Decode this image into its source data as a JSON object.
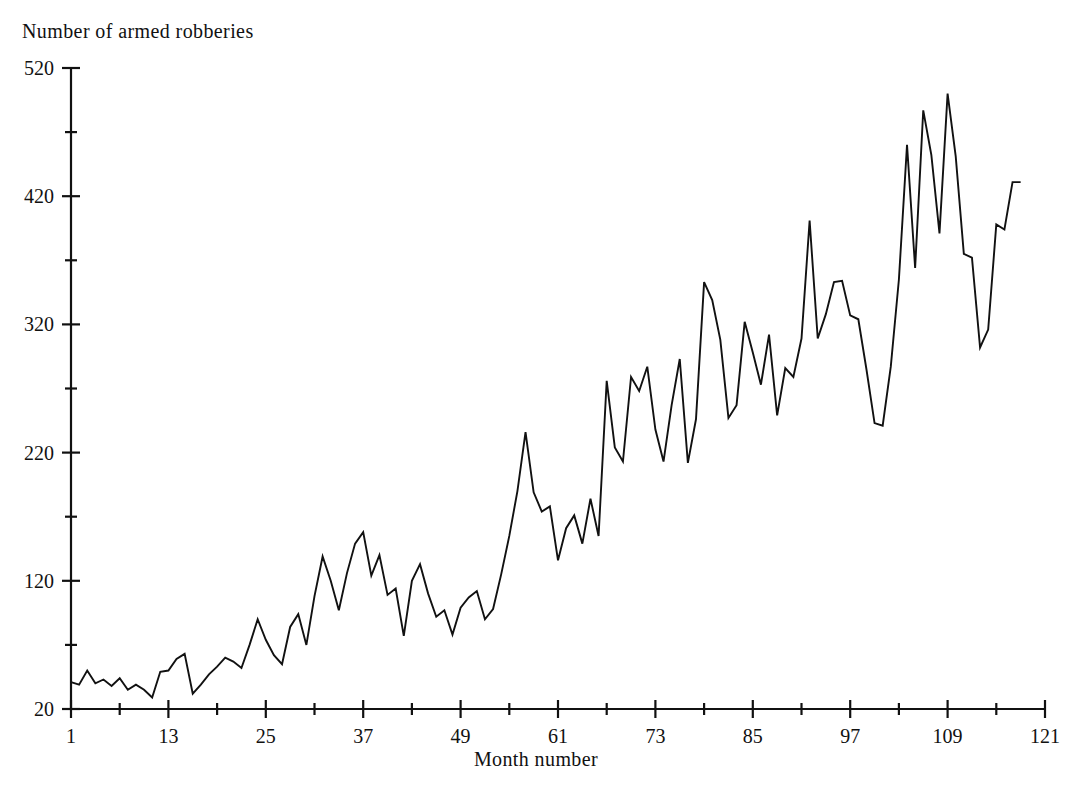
{
  "chart_data": {
    "type": "line",
    "title": "",
    "ylabel": "Number of armed robberies",
    "xlabel": "Month number",
    "ylim": [
      20,
      520
    ],
    "xlim": [
      1,
      121
    ],
    "grid": false,
    "legend": "none",
    "y_ticks": [
      20,
      120,
      220,
      320,
      420,
      520
    ],
    "y_tick_labels": [
      "20",
      "120",
      "220",
      "320",
      "420",
      "520"
    ],
    "y_minor_ticks": [
      70,
      170,
      270,
      370,
      470
    ],
    "x_ticks": [
      1,
      13,
      25,
      37,
      49,
      61,
      73,
      85,
      97,
      109,
      121
    ],
    "x_tick_labels": [
      "1",
      "13",
      "25",
      "37",
      "49",
      "61",
      "73",
      "85",
      "97",
      "109",
      "121"
    ],
    "x_minor_ticks": [
      7,
      19,
      31,
      43,
      55,
      67,
      79,
      91,
      103,
      115
    ],
    "series": [
      {
        "name": "Armed robberies",
        "x": [
          1,
          2,
          3,
          4,
          5,
          6,
          7,
          8,
          9,
          10,
          11,
          12,
          13,
          14,
          15,
          16,
          17,
          18,
          19,
          20,
          21,
          22,
          23,
          24,
          25,
          26,
          27,
          28,
          29,
          30,
          31,
          32,
          33,
          34,
          35,
          36,
          37,
          38,
          39,
          40,
          41,
          42,
          43,
          44,
          45,
          46,
          47,
          48,
          49,
          50,
          51,
          52,
          53,
          54,
          55,
          56,
          57,
          58,
          59,
          60,
          61,
          62,
          63,
          64,
          65,
          66,
          67,
          68,
          69,
          70,
          71,
          72,
          73,
          74,
          75,
          76,
          77,
          78,
          79,
          80,
          81,
          82,
          83,
          84,
          85,
          86,
          87,
          88,
          89,
          90,
          91,
          92,
          93,
          94,
          95,
          96,
          97,
          98,
          99,
          100,
          101,
          102,
          103,
          104,
          105,
          106,
          107,
          108,
          109,
          110,
          111,
          112,
          113,
          114,
          115,
          116,
          117,
          118
        ],
        "values": [
          41,
          39,
          50,
          40,
          43,
          38,
          44,
          35,
          39,
          35,
          29,
          49,
          50,
          59,
          63,
          32,
          39,
          47,
          53,
          60,
          57,
          52,
          70,
          90,
          74,
          62,
          55,
          84,
          94,
          70,
          108,
          139,
          120,
          97,
          126,
          149,
          158,
          124,
          140,
          109,
          114,
          77,
          120,
          133,
          110,
          92,
          97,
          78,
          99,
          107,
          112,
          90,
          98,
          125,
          155,
          190,
          236,
          189,
          174,
          178,
          136,
          161,
          171,
          149,
          184,
          155,
          276,
          224,
          213,
          279,
          268,
          287,
          238,
          213,
          257,
          293,
          212,
          246,
          353,
          339,
          308,
          247,
          257,
          322,
          298,
          273,
          312,
          249,
          286,
          279,
          309,
          401,
          309,
          328,
          353,
          354,
          327,
          324,
          285,
          243,
          241,
          287,
          355,
          460,
          364,
          487,
          452,
          391,
          500,
          451,
          375,
          372,
          302,
          316,
          398,
          394,
          431,
          431
        ]
      }
    ]
  }
}
